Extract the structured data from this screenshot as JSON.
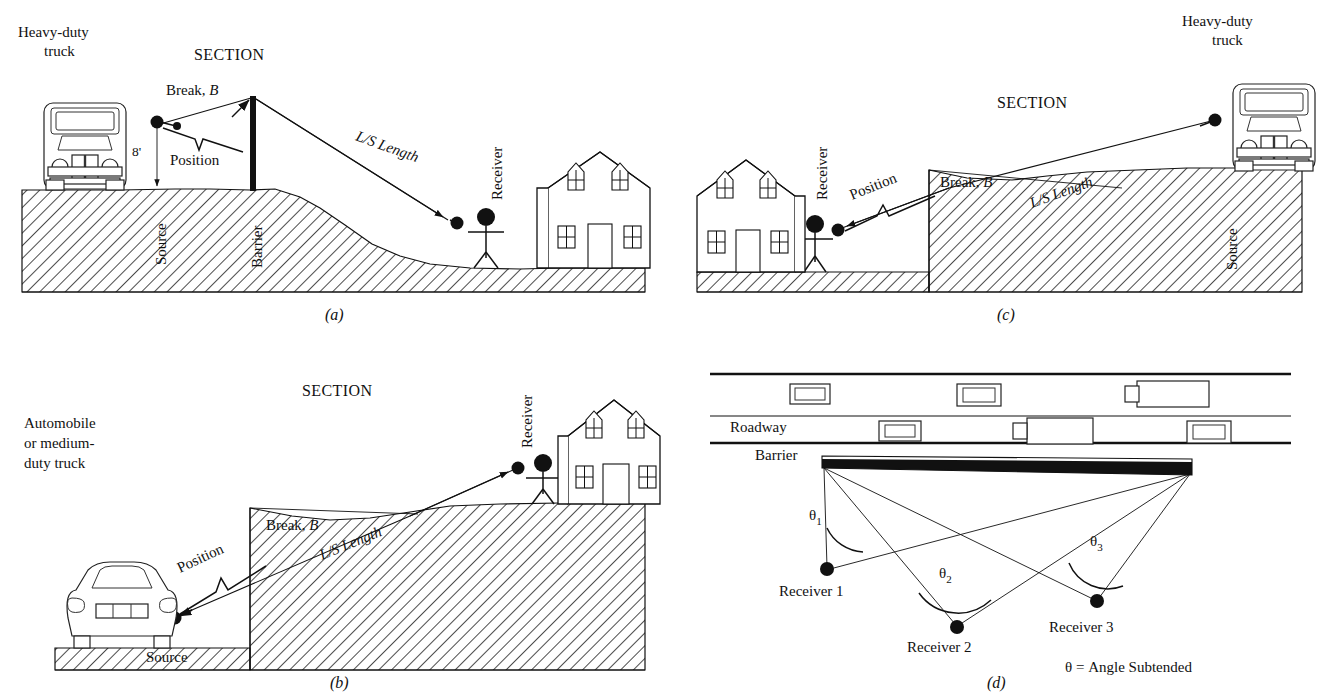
{
  "figure": {
    "background_color": "#ffffff",
    "ink_color": "#111111"
  },
  "common": {
    "section_label": "SECTION",
    "break_label": "Break, B",
    "break_italic_b": "B",
    "position_label": "Position",
    "ls_length_label": "L/S Length",
    "source_label": "Source",
    "receiver_label": "Receiver",
    "barrier_label": "Barrier"
  },
  "panels": {
    "a": {
      "key": "(a)",
      "vehicle_label_line1": "Heavy-duty",
      "vehicle_label_line2": "truck",
      "vehicle_type": "heavy-duty-truck",
      "section_label": "SECTION",
      "height_dimension": "8'",
      "break_label": "Break, B",
      "position_label": "Position",
      "ls_length_label": "L/S Length",
      "source_label": "Source",
      "barrier_label": "Barrier",
      "receiver_label": "Receiver",
      "description": "Source on upper flat grade behind a vertical barrier; ground falls away on a slope to a lower grade where the receiver and house stand."
    },
    "b": {
      "key": "(b)",
      "vehicle_label_line1": "Automobile",
      "vehicle_label_line2": "or medium-",
      "vehicle_label_line3": "duty truck",
      "vehicle_type": "automobile",
      "section_label": "SECTION",
      "break_label": "Break, B",
      "position_label": "Position",
      "ls_length_label": "L/S Length",
      "source_label": "Source",
      "receiver_label": "Receiver",
      "description": "Source at low grade on the left; terrain rises abruptly at a break to a raised berm; receiver and house sit on top of the raised ground to the right."
    },
    "c": {
      "key": "(c)",
      "vehicle_label_line1": "Heavy-duty",
      "vehicle_label_line2": "truck",
      "vehicle_type": "heavy-duty-truck",
      "section_label": "SECTION",
      "break_label": "Break, B",
      "position_label": "Position",
      "ls_length_label": "L/S Length",
      "source_label": "Source",
      "receiver_label": "Receiver",
      "description": "Mirror of (b): receiver and house at low grade on the left, terrain break rises to the right, source truck on the elevated grade."
    },
    "d": {
      "key": "(d)",
      "roadway_label": "Roadway",
      "barrier_label": "Barrier",
      "angle_note": "θ = Angle Subtended",
      "description": "Plan view of roadway with two traffic lanes, a barrier strip, and three receivers; each receiver subtends an angle between the barrier end points.",
      "theta_labels": [
        {
          "id": "theta-1",
          "base": "θ",
          "sub": "1"
        },
        {
          "id": "theta-2",
          "base": "θ",
          "sub": "2"
        },
        {
          "id": "theta-3",
          "base": "θ",
          "sub": "3"
        }
      ],
      "receivers": [
        {
          "id": "receiver-1",
          "label": "Receiver 1"
        },
        {
          "id": "receiver-2",
          "label": "Receiver 2"
        },
        {
          "id": "receiver-3",
          "label": "Receiver 3"
        }
      ],
      "lane_upper_vehicles": [
        "car",
        "car",
        "truck"
      ],
      "lane_lower_vehicles": [
        "car",
        "truck",
        "car"
      ]
    }
  }
}
